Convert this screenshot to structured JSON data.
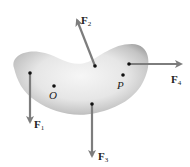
{
  "diagram": {
    "type": "rigid-body-forces",
    "body": {
      "shape": "kidney-shaped body",
      "fill_light": "#f4f4f4",
      "fill_dark": "#9c9c9c"
    },
    "arrow_color": "#7d7d7d",
    "points": [
      {
        "id": "O",
        "label": "O",
        "x": 54,
        "y": 86
      },
      {
        "id": "P",
        "label": "P",
        "x": 123,
        "y": 75
      }
    ],
    "forces": [
      {
        "id": "F1",
        "letter": "F",
        "sub": "1",
        "tail": [
          30,
          73
        ],
        "tip": [
          30,
          124
        ]
      },
      {
        "id": "F2",
        "letter": "F",
        "sub": "2",
        "tail": [
          95,
          66
        ],
        "tip": [
          76,
          17
        ]
      },
      {
        "id": "F3",
        "letter": "F",
        "sub": "3",
        "tail": [
          92,
          104
        ],
        "tip": [
          92,
          158
        ]
      },
      {
        "id": "F4",
        "letter": "F",
        "sub": "4",
        "tail": [
          129,
          64
        ],
        "tip": [
          183,
          64
        ]
      }
    ]
  }
}
